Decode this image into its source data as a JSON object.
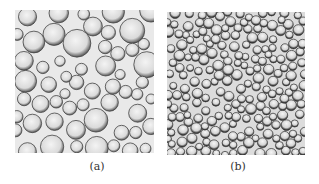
{
  "figure": {
    "panels": [
      {
        "id": "a",
        "caption": "(a)",
        "description": "Micrograph of large, polydisperse spherical bubbles/droplets",
        "bubble_size": "large"
      },
      {
        "id": "b",
        "caption": "(b)",
        "description": "Micrograph of small, densely packed spherical bubbles/droplets",
        "bubble_size": "small"
      }
    ]
  }
}
